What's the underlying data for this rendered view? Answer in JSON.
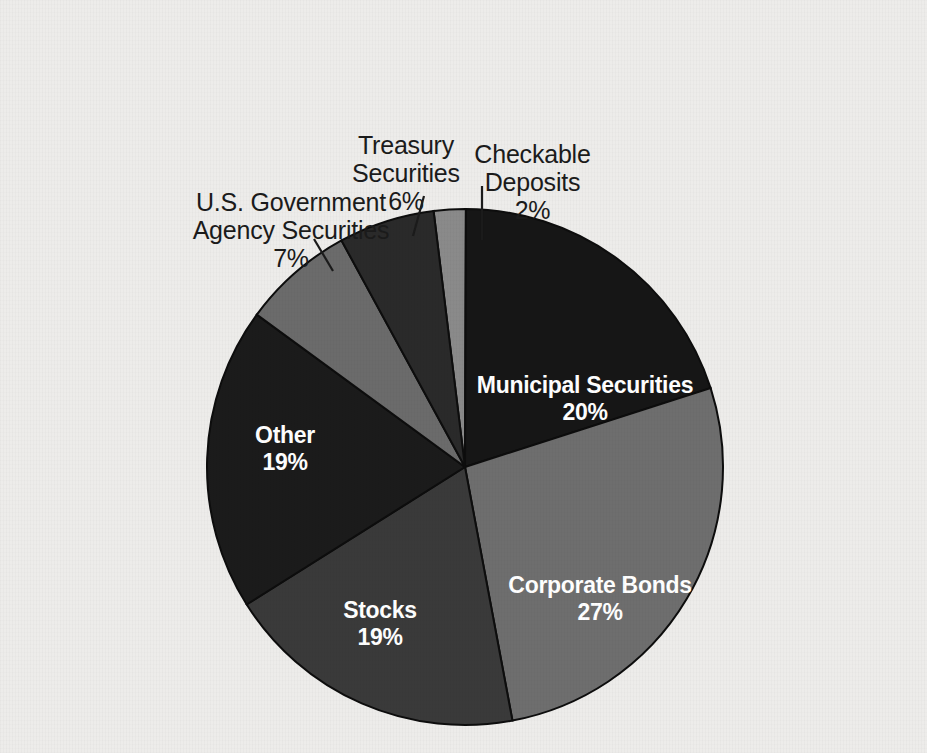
{
  "background_color": "#edecea",
  "chart_data": {
    "type": "pie",
    "title": "",
    "subtitle": "",
    "xlabel": "",
    "ylabel": "",
    "legend_position": "none",
    "grid": false,
    "value_unit": "%",
    "center": {
      "x": 465,
      "y": 467,
      "radius": 258
    },
    "start_angle_deg": -97,
    "direction": "clockwise",
    "categories": [
      "Checkable Deposits",
      "Municipal Securities",
      "Corporate Bonds",
      "Stocks",
      "Other",
      "U.S. Government Agency Securities",
      "Treasury Securities"
    ],
    "values": [
      2,
      20,
      27,
      19,
      19,
      7,
      6
    ],
    "slices": [
      {
        "id": "checkable-deposits",
        "label": "Checkable\nDeposits",
        "value": 2,
        "value_text": "2%",
        "color": "#8a8a8a",
        "label_placement": "outside",
        "label_text_color": "#1b1b1b"
      },
      {
        "id": "municipal-securities",
        "label": "Municipal Securities",
        "value": 20,
        "value_text": "20%",
        "color": "#161616",
        "label_placement": "inside",
        "label_text_color": "#ffffff"
      },
      {
        "id": "corporate-bonds",
        "label": "Corporate Bonds",
        "value": 27,
        "value_text": "27%",
        "color": "#6e6e6e",
        "label_placement": "inside",
        "label_text_color": "#ffffff"
      },
      {
        "id": "stocks",
        "label": "Stocks",
        "value": 19,
        "value_text": "19%",
        "color": "#3a3a3a",
        "label_placement": "inside",
        "label_text_color": "#ffffff"
      },
      {
        "id": "other",
        "label": "Other",
        "value": 19,
        "value_text": "19%",
        "color": "#1b1b1b",
        "label_placement": "inside",
        "label_text_color": "#ffffff"
      },
      {
        "id": "us-government-agency-securities",
        "label": "U.S. Government\nAgency Securities",
        "value": 7,
        "value_text": "7%",
        "color": "#6b6b6b",
        "label_placement": "outside",
        "label_text_color": "#1b1b1b"
      },
      {
        "id": "treasury-securities",
        "label": "Treasury\nSecurities",
        "value": 6,
        "value_text": "6%",
        "color": "#2a2a2a",
        "label_placement": "outside",
        "label_text_color": "#1b1b1b"
      }
    ]
  }
}
